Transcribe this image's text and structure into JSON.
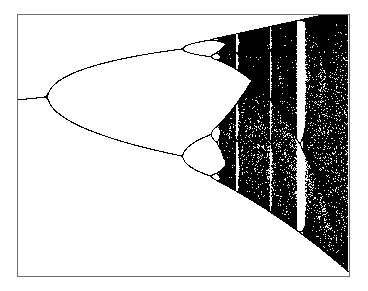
{
  "chart_data": {
    "type": "scatter",
    "title": "",
    "subtitle": "",
    "xlabel": "",
    "ylabel": "",
    "map": "logistic",
    "x_parameter": "r",
    "xlim": [
      2.9,
      4.0
    ],
    "ylim": [
      0.0,
      1.0
    ],
    "grid": false,
    "legend": null,
    "tick_labels_visible": false,
    "features": [
      {
        "label": "period-1 fixed point",
        "r_range": [
          2.9,
          3.0
        ],
        "value": 0.667
      },
      {
        "label": "period-doubling to period-2",
        "r": 3.0
      },
      {
        "label": "period-doubling to period-4",
        "r": 3.449,
        "values": [
          0.44,
          0.849
        ]
      },
      {
        "label": "period-doubling to period-8",
        "r": 3.544
      },
      {
        "label": "onset of chaos",
        "r": 3.57
      },
      {
        "label": "period-3 window",
        "r_range": [
          3.828,
          3.857
        ]
      },
      {
        "label": "fully chaotic band",
        "r": 4.0,
        "values_range": [
          0.0,
          1.0
        ]
      }
    ],
    "colors": {
      "points": "#000000",
      "background": "#ffffff",
      "frame": "#6e6e6e"
    },
    "sampling": {
      "transient_iterations": 300,
      "plotted_iterations": 260,
      "columns": 331
    }
  }
}
